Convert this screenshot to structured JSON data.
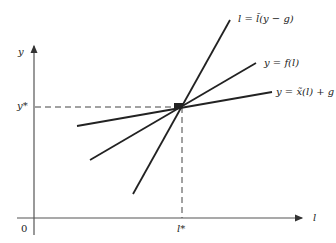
{
  "diagram": {
    "axes": {
      "x_label": "l",
      "y_label": "y",
      "origin_label": "0",
      "x_star_label": "l*",
      "y_star_label": "y*"
    },
    "lines": [
      {
        "name": "l-equals-ltilde",
        "label": "l = l̃(y − g)",
        "from": [
          133,
          194
        ],
        "to": [
          230,
          20
        ]
      },
      {
        "name": "y-equals-f",
        "label": "y = f(l)",
        "from": [
          90,
          160
        ],
        "to": [
          256,
          63
        ]
      },
      {
        "name": "y-equals-xtilde-plus-g",
        "label": "y = x̃(l) + g",
        "from": [
          77,
          126
        ],
        "to": [
          272,
          92
        ]
      }
    ],
    "intersection": [
      182,
      107
    ],
    "colors": {
      "line": "#222222",
      "axis": "#555555"
    }
  }
}
